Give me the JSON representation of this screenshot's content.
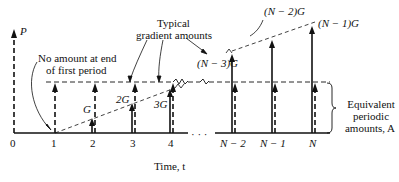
{
  "diagram": {
    "type": "cash-flow-diagram",
    "axis": {
      "label": "Time, t",
      "ticks": [
        "0",
        "1",
        "2",
        "3",
        "4",
        "N − 2",
        "N − 1",
        "N"
      ],
      "ellipsis": "· · ·"
    },
    "present_value_label": "P",
    "annotations": {
      "no_amount_line1": "No amount at end",
      "no_amount_line2": "of first period",
      "typical_line1": "Typical",
      "typical_line2": "gradient amounts",
      "equivalent_line1": "Equivalent",
      "equivalent_line2": "periodic",
      "equivalent_line3": "amounts, A"
    },
    "gradient_labels": {
      "g1": "G",
      "g2": "2G",
      "g3": "3G",
      "gN3": "(N − 3)G",
      "gN2": "(N − 2)G",
      "gN1": "(N − 1)G"
    },
    "colors": {
      "ink": "#111111",
      "background": "#ffffff"
    }
  }
}
